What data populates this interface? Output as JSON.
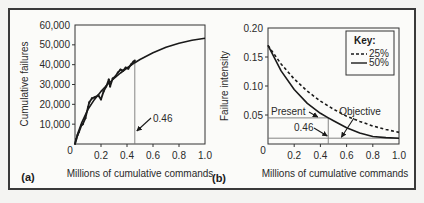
{
  "chart_data": [
    {
      "id": "a",
      "type": "line",
      "panel_label": "(a)",
      "title": "",
      "xlabel": "Millions of cumulative commands",
      "ylabel": "Cumulative failures",
      "xlim": [
        0,
        1.0
      ],
      "ylim": [
        0,
        60000
      ],
      "x_ticks": [
        0.2,
        0.4,
        0.6,
        0.8,
        1.0
      ],
      "x_tick_labels": [
        "0.2",
        "0.4",
        "0.6",
        "0.8",
        "1.0"
      ],
      "origin_label": "0",
      "y_ticks": [
        10000,
        20000,
        30000,
        40000,
        50000,
        60000
      ],
      "y_tick_labels": [
        "10,000",
        "20,000",
        "30,000",
        "40,000",
        "50,000",
        "60,000"
      ],
      "grid": false,
      "series": [
        {
          "name": "fitted model",
          "style": "solid",
          "x": [
            0,
            0.02,
            0.05,
            0.1,
            0.15,
            0.2,
            0.25,
            0.3,
            0.35,
            0.4,
            0.46,
            0.5,
            0.6,
            0.7,
            0.8,
            0.9,
            1.0
          ],
          "y": [
            0,
            5000,
            10500,
            17500,
            22500,
            26500,
            30000,
            33000,
            35800,
            38300,
            41000,
            42600,
            46000,
            48800,
            50800,
            52300,
            53300
          ]
        },
        {
          "name": "observed data",
          "style": "jagged",
          "x": [
            0,
            0.01,
            0.02,
            0.03,
            0.05,
            0.06,
            0.08,
            0.1,
            0.11,
            0.13,
            0.15,
            0.18,
            0.2,
            0.22,
            0.24,
            0.26,
            0.27,
            0.29,
            0.31,
            0.33,
            0.35,
            0.37,
            0.39,
            0.41,
            0.43,
            0.45,
            0.46
          ],
          "y": [
            0,
            2500,
            4500,
            6000,
            9500,
            10000,
            13000,
            18500,
            21000,
            23000,
            23500,
            24500,
            22500,
            26500,
            29000,
            32500,
            29000,
            33000,
            34000,
            36000,
            37500,
            37000,
            38500,
            38000,
            40000,
            41500,
            42000
          ]
        }
      ],
      "reference_lines": [
        {
          "axis": "x",
          "value": 0.46
        }
      ],
      "annotations": [
        {
          "text": "0.46",
          "points_to_x": 0.46
        }
      ]
    },
    {
      "id": "b",
      "type": "line",
      "panel_label": "(b)",
      "title": "",
      "xlabel": "Millions of cumulative commands",
      "ylabel": "Failure intensity",
      "xlim": [
        0,
        1.0
      ],
      "ylim": [
        0,
        0.2
      ],
      "x_ticks": [
        0.2,
        0.4,
        0.6,
        0.8,
        1.0
      ],
      "x_tick_labels": [
        "0.2",
        "0.4",
        "0.6",
        "0.8",
        "1.0"
      ],
      "origin_label": "0",
      "y_ticks": [
        0.05,
        0.1,
        0.15,
        0.2
      ],
      "y_tick_labels": [
        "0.05",
        "0.10",
        "0.15",
        "0.20"
      ],
      "grid": false,
      "legend": {
        "title": "Key:",
        "placement": "top-right"
      },
      "series": [
        {
          "name": "25%",
          "style": "dashed",
          "x": [
            0,
            0.1,
            0.2,
            0.3,
            0.4,
            0.5,
            0.6,
            0.7,
            0.8,
            0.9,
            1.0
          ],
          "y": [
            0.17,
            0.138,
            0.112,
            0.091,
            0.074,
            0.06,
            0.048,
            0.039,
            0.031,
            0.025,
            0.02
          ]
        },
        {
          "name": "50%",
          "style": "solid",
          "x": [
            0,
            0.1,
            0.2,
            0.3,
            0.4,
            0.46,
            0.5,
            0.6,
            0.7,
            0.8,
            0.9,
            1.0
          ],
          "y": [
            0.17,
            0.126,
            0.094,
            0.07,
            0.053,
            0.045,
            0.04,
            0.028,
            0.019,
            0.013,
            0.011,
            0.01
          ]
        }
      ],
      "reference_lines": [
        {
          "axis": "y",
          "value": 0.045,
          "label": "Present"
        },
        {
          "axis": "y",
          "value": 0.01,
          "label": "Objective"
        },
        {
          "axis": "x",
          "value": 0.46
        }
      ],
      "annotations": [
        {
          "text": "Present",
          "points_to": [
            0.4,
            0.045
          ]
        },
        {
          "text": "0.46",
          "points_to_x": 0.46
        },
        {
          "text": "Objective",
          "points_to": [
            0.58,
            0.01
          ]
        }
      ]
    }
  ]
}
